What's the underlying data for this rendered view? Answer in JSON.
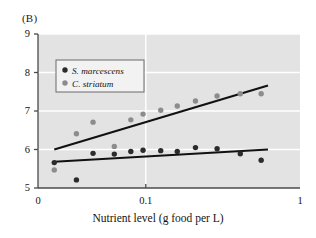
{
  "panel": {
    "label": "(B)"
  },
  "chart_data": {
    "type": "scatter",
    "title": "",
    "xlabel": "Nutrient level (g food per L)",
    "ylabel": "",
    "xscale": "log",
    "yscale": "linear",
    "xlim": [
      0.02,
      1.0
    ],
    "ylim": [
      5,
      9
    ],
    "xticks": [
      0.02,
      0.1,
      1
    ],
    "xtick_labels": [
      "0",
      "0.1",
      "1"
    ],
    "yticks": [
      5,
      6,
      7,
      8,
      9
    ],
    "ytick_labels": [
      "5",
      "6",
      "7",
      "8",
      "9"
    ],
    "grid": {
      "horizontal": true,
      "vertical": true,
      "color": "#ffffff"
    },
    "plot_background": "#e3e3e3",
    "legend": {
      "position": "upper-left",
      "entries": [
        {
          "name": "S. marcescens",
          "color": "#2b2b2b",
          "marker": "circle"
        },
        {
          "name": "C. striatum",
          "color": "#8c8c8c",
          "marker": "circle"
        }
      ]
    },
    "series": [
      {
        "name": "S. marcescens",
        "color": "#2b2b2b",
        "points": [
          {
            "x": 0.0255,
            "y": 5.66
          },
          {
            "x": 0.0355,
            "y": 5.21
          },
          {
            "x": 0.0455,
            "y": 5.9
          },
          {
            "x": 0.0625,
            "y": 5.88
          },
          {
            "x": 0.08,
            "y": 5.95
          },
          {
            "x": 0.096,
            "y": 5.98
          },
          {
            "x": 0.125,
            "y": 5.97
          },
          {
            "x": 0.16,
            "y": 5.95
          },
          {
            "x": 0.21,
            "y": 6.05
          },
          {
            "x": 0.29,
            "y": 6.02
          },
          {
            "x": 0.41,
            "y": 5.89
          },
          {
            "x": 0.56,
            "y": 5.72
          }
        ],
        "fit_line": {
          "x0": 0.0255,
          "y0": 5.68,
          "x1": 0.62,
          "y1": 6.0
        }
      },
      {
        "name": "C. striatum",
        "color": "#8c8c8c",
        "points": [
          {
            "x": 0.0255,
            "y": 5.47
          },
          {
            "x": 0.0355,
            "y": 6.41
          },
          {
            "x": 0.0455,
            "y": 6.71
          },
          {
            "x": 0.0625,
            "y": 6.08
          },
          {
            "x": 0.08,
            "y": 6.77
          },
          {
            "x": 0.096,
            "y": 6.92
          },
          {
            "x": 0.125,
            "y": 7.02
          },
          {
            "x": 0.16,
            "y": 7.13
          },
          {
            "x": 0.21,
            "y": 7.26
          },
          {
            "x": 0.29,
            "y": 7.39
          },
          {
            "x": 0.41,
            "y": 7.45
          },
          {
            "x": 0.56,
            "y": 7.45
          }
        ],
        "fit_line": {
          "x0": 0.0255,
          "y0": 6.0,
          "x1": 0.62,
          "y1": 7.66
        }
      }
    ]
  }
}
